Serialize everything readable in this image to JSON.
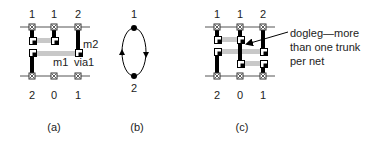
{
  "panels": {
    "a": {
      "caption": "(a)",
      "top_pins": [
        "1",
        "1",
        "2"
      ],
      "bottom_pins": [
        "2",
        "0",
        "1"
      ],
      "labels": {
        "m2": "m2",
        "m1": "m1",
        "via1": "via1"
      }
    },
    "b": {
      "caption": "(b)",
      "nodes": [
        "1",
        "2"
      ]
    },
    "c": {
      "caption": "(c)",
      "top_pins": [
        "1",
        "1",
        "2"
      ],
      "bottom_pins": [
        "2",
        "0",
        "1"
      ],
      "annotation": [
        "dogleg—more",
        "than one trunk",
        "per net"
      ]
    }
  },
  "colors": {
    "wire_m2": "#000000",
    "wire_m1": "#c8c8c8",
    "rail": "#555555"
  }
}
